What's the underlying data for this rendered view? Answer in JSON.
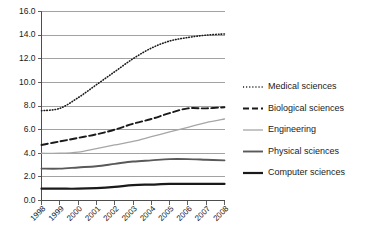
{
  "chart_data": {
    "type": "line",
    "title": "",
    "subtitle": "",
    "xlabel": "",
    "ylabel": "",
    "grid": true,
    "legend_position": "right",
    "ylim": [
      0.0,
      16.0
    ],
    "ytick_labels": [
      "16.0",
      "14.0",
      "12.0",
      "10.0",
      "8.0",
      "6.0",
      "4.0",
      "2.0",
      "0.0"
    ],
    "ytick_values": [
      16.0,
      14.0,
      12.0,
      10.0,
      8.0,
      6.0,
      4.0,
      2.0,
      0.0
    ],
    "categories": [
      "1998",
      "1999",
      "2000",
      "2001",
      "2002",
      "2003",
      "2004",
      "2005",
      "2006",
      "2007",
      "2008"
    ],
    "series": [
      {
        "name": "Medical sciences",
        "style": "dotted",
        "color": "#1a1a1a",
        "width": 1.6,
        "dash": "0.6,2.1",
        "legend_dash": "1.1,2.0",
        "values": [
          7.6,
          7.8,
          8.7,
          9.8,
          10.9,
          12.0,
          12.9,
          13.5,
          13.8,
          14.0,
          14.1
        ]
      },
      {
        "name": "Biological sciences",
        "style": "dashed",
        "color": "#1a1a1a",
        "width": 1.9,
        "dash": "6.5,3.2",
        "legend_dash": "6.0,3.0",
        "values": [
          4.7,
          5.0,
          5.3,
          5.6,
          6.0,
          6.5,
          6.9,
          7.4,
          7.8,
          7.8,
          7.9
        ]
      },
      {
        "name": "Engineering",
        "style": "solid",
        "color": "#a6a6a6",
        "width": 1.3,
        "dash": "",
        "legend_dash": "",
        "values": [
          4.0,
          4.0,
          4.1,
          4.4,
          4.7,
          5.0,
          5.4,
          5.8,
          6.2,
          6.6,
          6.9
        ]
      },
      {
        "name": "Physical sciences",
        "style": "solid",
        "color": "#595959",
        "width": 1.9,
        "dash": "",
        "legend_dash": "",
        "values": [
          2.7,
          2.7,
          2.8,
          2.9,
          3.1,
          3.3,
          3.4,
          3.5,
          3.5,
          3.45,
          3.4
        ]
      },
      {
        "name": "Computer sciences",
        "style": "solid",
        "color": "#1a1a1a",
        "width": 2.2,
        "dash": "",
        "legend_dash": "",
        "values": [
          1.0,
          1.0,
          1.0,
          1.05,
          1.15,
          1.3,
          1.35,
          1.4,
          1.4,
          1.4,
          1.4
        ]
      }
    ]
  }
}
